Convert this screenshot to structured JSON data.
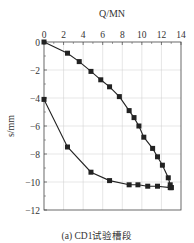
{
  "chart_data": {
    "type": "line",
    "title": "",
    "caption": "(a) CD1试验槽段",
    "xlabel": "Q/MN",
    "ylabel": "s/mm",
    "xlim": [
      0,
      14
    ],
    "ylim": [
      -12,
      0
    ],
    "x_ticks": [
      0,
      2,
      4,
      6,
      8,
      10,
      12,
      14
    ],
    "y_ticks": [
      0,
      -2,
      -4,
      -6,
      -8,
      -10,
      -12
    ],
    "x_axis_position": "top",
    "grid": true,
    "legend": null,
    "series": [
      {
        "name": "loading",
        "marker": "square",
        "x": [
          0,
          2.4,
          3.6,
          4.8,
          5.8,
          6.7,
          7.7,
          8.7,
          9.2,
          9.7,
          10.2,
          11.1,
          11.6,
          12.1,
          12.7,
          12.9,
          13.0
        ],
        "y": [
          0,
          -0.8,
          -1.4,
          -2.1,
          -2.7,
          -3.2,
          -3.9,
          -4.9,
          -5.4,
          -6.0,
          -6.8,
          -7.6,
          -8.2,
          -8.8,
          -9.7,
          -10.2,
          -10.4
        ]
      },
      {
        "name": "unloading",
        "marker": "square",
        "x": [
          0,
          2.4,
          4.8,
          6.7,
          8.7,
          9.6,
          10.6,
          11.6,
          12.9,
          13.0
        ],
        "y": [
          -4.1,
          -7.5,
          -9.3,
          -9.9,
          -10.2,
          -10.2,
          -10.3,
          -10.3,
          -10.4,
          -10.4
        ]
      }
    ]
  }
}
